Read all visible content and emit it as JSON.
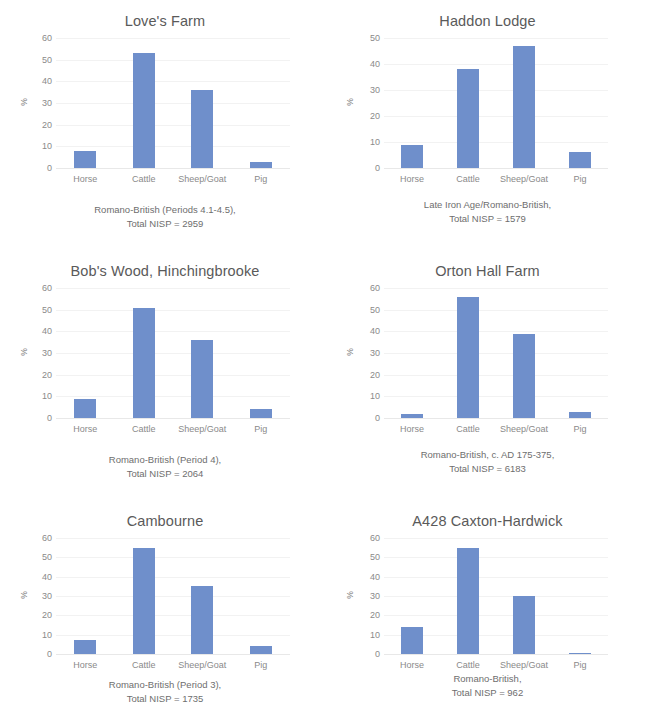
{
  "page": {
    "background": "#ffffff",
    "bar_color": "#6f8fcb",
    "title_color": "#595959",
    "tick_color": "#8a8a8a",
    "gridline_color": "#f2f2f2"
  },
  "common": {
    "y_axis_title": "%",
    "categories": [
      "Horse",
      "Cattle",
      "Sheep/Goat",
      "Pig"
    ]
  },
  "chart_data": [
    {
      "type": "bar",
      "title": "Love's Farm",
      "categories": [
        "Horse",
        "Cattle",
        "Sheep/Goat",
        "Pig"
      ],
      "values": [
        8,
        53,
        36,
        3
      ],
      "xlabel": "",
      "ylabel": "%",
      "ylim": [
        0,
        60
      ],
      "yticks": [
        0,
        10,
        20,
        30,
        40,
        50,
        60
      ],
      "grid": true,
      "legend": "none",
      "caption_line1": "Romano-British (Periods 4.1-4.5),",
      "caption_line2": "Total NISP = 2959"
    },
    {
      "type": "bar",
      "title": "Haddon Lodge",
      "categories": [
        "Horse",
        "Cattle",
        "Sheep/Goat",
        "Pig"
      ],
      "values": [
        9,
        38,
        47,
        6
      ],
      "xlabel": "",
      "ylabel": "%",
      "ylim": [
        0,
        50
      ],
      "yticks": [
        0,
        10,
        20,
        30,
        40,
        50
      ],
      "grid": true,
      "legend": "none",
      "caption_line1": "Late Iron Age/Romano-British,",
      "caption_line2": "Total NISP = 1579"
    },
    {
      "type": "bar",
      "title": "Bob's Wood, Hinchingbrooke",
      "categories": [
        "Horse",
        "Cattle",
        "Sheep/Goat",
        "Pig"
      ],
      "values": [
        9,
        51,
        36,
        4
      ],
      "xlabel": "",
      "ylabel": "%",
      "ylim": [
        0,
        60
      ],
      "yticks": [
        0,
        10,
        20,
        30,
        40,
        50,
        60
      ],
      "grid": true,
      "legend": "none",
      "caption_line1": "Romano-British (Period 4),",
      "caption_line2": "Total NISP = 2064"
    },
    {
      "type": "bar",
      "title": "Orton Hall Farm",
      "categories": [
        "Horse",
        "Cattle",
        "Sheep/Goat",
        "Pig"
      ],
      "values": [
        2,
        56,
        39,
        3
      ],
      "xlabel": "",
      "ylabel": "%",
      "ylim": [
        0,
        60
      ],
      "yticks": [
        0,
        10,
        20,
        30,
        40,
        50,
        60
      ],
      "grid": true,
      "legend": "none",
      "caption_line1": "Romano-British, c. AD 175-375,",
      "caption_line2": "Total NISP = 6183"
    },
    {
      "type": "bar",
      "title": "Cambourne",
      "categories": [
        "Horse",
        "Cattle",
        "Sheep/Goat",
        "Pig"
      ],
      "values": [
        7,
        55,
        35,
        4
      ],
      "xlabel": "",
      "ylabel": "%",
      "ylim": [
        0,
        60
      ],
      "yticks": [
        0,
        10,
        20,
        30,
        40,
        50,
        60
      ],
      "grid": true,
      "legend": "none",
      "caption_line1": "Romano-British (Period 3),",
      "caption_line2": "Total NISP = 1735"
    },
    {
      "type": "bar",
      "title": "A428 Caxton-Hardwick",
      "categories": [
        "Horse",
        "Cattle",
        "Sheep/Goat",
        "Pig"
      ],
      "values": [
        14,
        55,
        30,
        0.6
      ],
      "xlabel": "",
      "ylabel": "%",
      "ylim": [
        0,
        60
      ],
      "yticks": [
        0,
        10,
        20,
        30,
        40,
        50,
        60
      ],
      "grid": true,
      "legend": "none",
      "caption_line1": "Romano-British,",
      "caption_line2": "Total NISP = 962"
    }
  ]
}
